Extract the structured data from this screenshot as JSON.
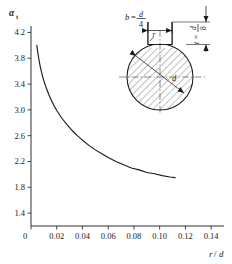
{
  "figure": {
    "background": "#ffffff",
    "ink": "#1a1a1a",
    "curve_color": "#1a1a1a"
  },
  "axes": {
    "y_axis_title": "α",
    "y_axis_title_sub": "t",
    "x_axis_title": "r",
    "x_axis_title_denominator": "d",
    "x_axis_title_slash": "/",
    "origin_label": "0"
  },
  "inset": {
    "width_label_lhs": "b",
    "width_label_eq": "=",
    "width_label_num": "d",
    "width_label_den": "4",
    "depth_label_lhs": "t",
    "depth_label_eq": "=",
    "depth_label_num": "d",
    "depth_label_den": "8",
    "fillet_label": "r",
    "diameter_label": "d"
  },
  "chart_data": {
    "type": "line",
    "title": "",
    "subtitle": "",
    "xlabel": "r/d",
    "ylabel": "αt",
    "xlim": [
      0,
      0.15
    ],
    "ylim": [
      1.2,
      4.3
    ],
    "grid": false,
    "legend_position": "none",
    "x_ticks": [
      0,
      0.02,
      0.04,
      0.06,
      0.08,
      0.1,
      0.12,
      0.14
    ],
    "x_tick_labels": [
      "0",
      "0.02",
      "0.04",
      "0.06",
      "0.08",
      "0.10",
      "0.12",
      "0.14"
    ],
    "y_ticks": [
      1.4,
      1.8,
      2.2,
      2.6,
      3.0,
      3.4,
      3.8,
      4.2
    ],
    "y_tick_labels": [
      "1.4",
      "1.8",
      "2.2",
      "2.6",
      "3.0",
      "3.4",
      "3.8",
      "4.2"
    ],
    "series": [
      {
        "name": "stress concentration factor",
        "x": [
          0.0045,
          0.005,
          0.006,
          0.007,
          0.008,
          0.009,
          0.01,
          0.012,
          0.014,
          0.016,
          0.018,
          0.02,
          0.024,
          0.028,
          0.032,
          0.036,
          0.04,
          0.045,
          0.05,
          0.055,
          0.06,
          0.066,
          0.072,
          0.078,
          0.084,
          0.09,
          0.096,
          0.102,
          0.108,
          0.112
        ],
        "y": [
          4.0,
          3.93,
          3.8,
          3.69,
          3.6,
          3.52,
          3.45,
          3.33,
          3.23,
          3.14,
          3.06,
          2.99,
          2.87,
          2.77,
          2.68,
          2.6,
          2.53,
          2.45,
          2.38,
          2.32,
          2.26,
          2.2,
          2.15,
          2.1,
          2.07,
          2.03,
          2.01,
          1.98,
          1.96,
          1.95
        ]
      }
    ]
  }
}
